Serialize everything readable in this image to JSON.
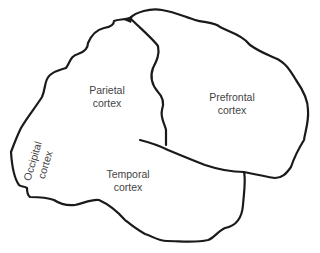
{
  "diagram": {
    "type": "brain-lateral-view",
    "regions": {
      "parietal": {
        "line1": "Parietal",
        "line2": "cortex"
      },
      "prefrontal": {
        "line1": "Prefrontal",
        "line2": "cortex"
      },
      "temporal": {
        "line1": "Temporal",
        "line2": "cortex"
      },
      "occipital": {
        "line1": "Occipital",
        "line2": "cortex"
      }
    },
    "colors": {
      "outline": "#1a1a1a",
      "label": "#444444",
      "background": "#ffffff"
    }
  }
}
